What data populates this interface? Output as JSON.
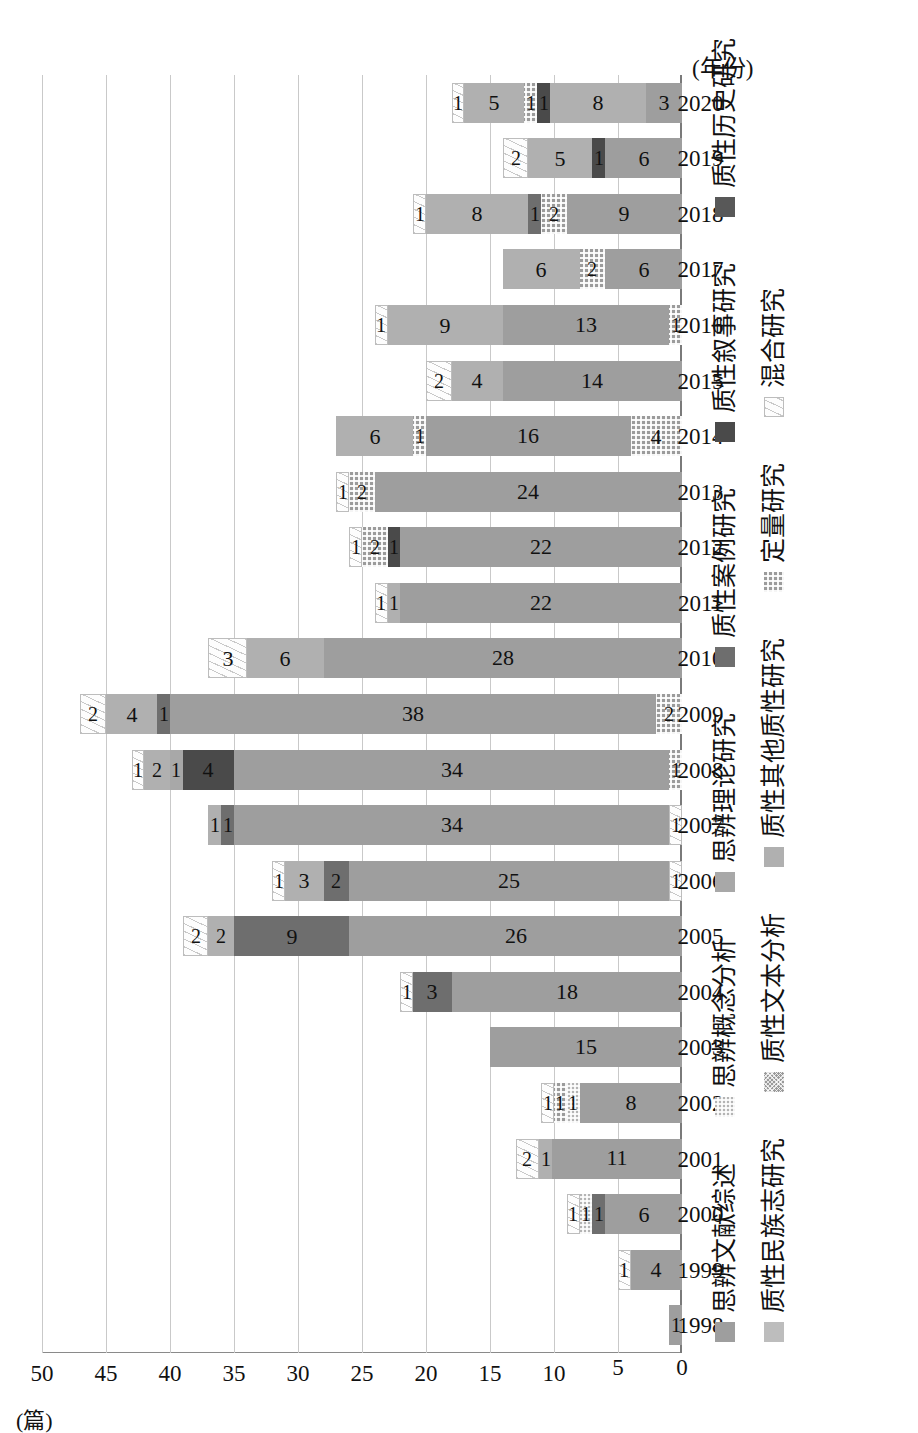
{
  "chart_data": {
    "type": "bar",
    "subtype": "stacked-bar",
    "orientation": "vertical (image rotated 90° counter-clockwise)",
    "title": "",
    "xlabel": "(年份)",
    "ylabel": "(篇)",
    "ylim": [
      0,
      50
    ],
    "ytick_step": 5,
    "yticks": [
      "0",
      "5",
      "10",
      "15",
      "20",
      "25",
      "30",
      "35",
      "40",
      "45",
      "50"
    ],
    "grid": "horizontal gridlines at every 5 units",
    "legend_position": "below plot, three rows",
    "categories": [
      "1998",
      "1999",
      "2000",
      "2001",
      "2002",
      "2003",
      "2004",
      "2005",
      "2006",
      "2007",
      "2008",
      "2009",
      "2010",
      "2011",
      "2012",
      "2013",
      "2014",
      "2015",
      "2016",
      "2017",
      "2018",
      "2019",
      "2020"
    ],
    "series": [
      {
        "name": "思辨文献综述",
        "key": "sbwxzs",
        "color": "#9e9e9e",
        "values": [
          1,
          4,
          6,
          11,
          8,
          15,
          18,
          26,
          25,
          34,
          34,
          38,
          28,
          22,
          22,
          24,
          16,
          14,
          13,
          6,
          9,
          6,
          3
        ]
      },
      {
        "name": "思辨概念分析",
        "key": "sbgnfx",
        "color": "#b4b4b4",
        "values": [
          0,
          0,
          1,
          0,
          1,
          0,
          0,
          0,
          0,
          0,
          0,
          0,
          0,
          0,
          0,
          0,
          0,
          0,
          0,
          0,
          0,
          0,
          0
        ]
      },
      {
        "name": "思辨理论研究",
        "key": "sbllyj",
        "color": "#a8a8a8",
        "values": [
          0,
          0,
          0,
          0,
          0,
          0,
          0,
          0,
          0,
          0,
          1,
          0,
          0,
          0,
          0,
          0,
          0,
          0,
          0,
          0,
          0,
          0,
          0
        ]
      },
      {
        "name": "质性民族志研究",
        "key": "zxmzz",
        "color": "#bdbdbd",
        "values": [
          0,
          0,
          0,
          0,
          0,
          0,
          0,
          0,
          0,
          0,
          0,
          0,
          0,
          0,
          0,
          0,
          0,
          0,
          0,
          0,
          0,
          0,
          0
        ]
      },
      {
        "name": "质性文本分析",
        "key": "zxwbfx",
        "color": "#9a9a9a",
        "values": [
          0,
          0,
          0,
          0,
          0,
          0,
          0,
          0,
          0,
          0,
          0,
          0,
          0,
          0,
          0,
          0,
          0,
          0,
          0,
          0,
          0,
          0,
          0
        ]
      },
      {
        "name": "质性其他质性研究",
        "key": "zxqtzx",
        "color": "#b0b0b0",
        "values": [
          0,
          0,
          0,
          0,
          0,
          0,
          0,
          0,
          0,
          0,
          0,
          0,
          0,
          0,
          0,
          0,
          0,
          0,
          0,
          0,
          0,
          0,
          0
        ]
      },
      {
        "name": "质性案例研究",
        "key": "zxalyj",
        "color": "#6e6e6e",
        "values": [
          0,
          0,
          1,
          0,
          0,
          0,
          3,
          9,
          2,
          1,
          4,
          0,
          0,
          1,
          0,
          0,
          0,
          0,
          0,
          0,
          0,
          0,
          0
        ]
      },
      {
        "name": "质性叙事研究",
        "key": "zxxsyj",
        "color": "#4a4a4a",
        "values": [
          0,
          0,
          0,
          0,
          0,
          0,
          0,
          0,
          0,
          0,
          0,
          0,
          0,
          0,
          0,
          0,
          0,
          0,
          0,
          0,
          0,
          1,
          1
        ]
      },
      {
        "name": "质性历史研究",
        "key": "zxlsyj",
        "color": "#585858",
        "values": [
          0,
          0,
          0,
          0,
          0,
          0,
          0,
          0,
          0,
          0,
          0,
          0,
          0,
          0,
          0,
          0,
          0,
          0,
          0,
          0,
          0,
          0,
          0
        ]
      },
      {
        "name": "定量研究",
        "key": "dlyj",
        "color": "#9b9b9b",
        "values": [
          0,
          0,
          0,
          0,
          1,
          0,
          0,
          0,
          0,
          0,
          0,
          0,
          0,
          0,
          2,
          2,
          1,
          0,
          0,
          2,
          2,
          0,
          1
        ]
      },
      {
        "name": "混合研究",
        "key": "hhyj",
        "color": "#fdfdfd",
        "values": [
          0,
          1,
          1,
          2,
          1,
          0,
          1,
          2,
          1,
          1,
          1,
          2,
          3,
          1,
          1,
          1,
          0,
          2,
          1,
          0,
          1,
          2,
          1
        ]
      }
    ],
    "base_segments": {
      "note": "small segments drawn at the zero end of some bars",
      "values": {
        "2006": 1,
        "2007": 1,
        "2008": 1,
        "2009": 2,
        "2014": 4,
        "2016": 1
      }
    },
    "bars": [
      {
        "year": "1998",
        "total": 1,
        "segments": [
          {
            "key": "sbwxzs",
            "value": 1,
            "label": "1"
          }
        ]
      },
      {
        "year": "1999",
        "total": 5,
        "segments": [
          {
            "key": "sbwxzs",
            "value": 4,
            "label": "4"
          },
          {
            "key": "hhyj",
            "value": 1,
            "label": "1"
          }
        ]
      },
      {
        "year": "2000",
        "total": 9,
        "segments": [
          {
            "key": "sbwxzs",
            "value": 6,
            "label": "6"
          },
          {
            "key": "zxalyj",
            "value": 1,
            "label": "1"
          },
          {
            "key": "sbgnfx",
            "value": 1,
            "label": "1"
          },
          {
            "key": "hhyj",
            "value": 1,
            "label": "1"
          }
        ]
      },
      {
        "year": "2001",
        "total": 13,
        "segments": [
          {
            "key": "sbwxzs",
            "value": 11,
            "label": "11"
          },
          {
            "key": "zxqtzx",
            "value": 1,
            "label": "1"
          },
          {
            "key": "hhyj",
            "value": 2,
            "label": "2"
          }
        ]
      },
      {
        "year": "2002",
        "total": 11,
        "segments": [
          {
            "key": "sbwxzs",
            "value": 8,
            "label": "8"
          },
          {
            "key": "sbgnfx",
            "value": 1,
            "label": "1"
          },
          {
            "key": "dlyj",
            "value": 1,
            "label": "1"
          },
          {
            "key": "hhyj",
            "value": 1,
            "label": "1"
          }
        ]
      },
      {
        "year": "2003",
        "total": 15,
        "segments": [
          {
            "key": "sbwxzs",
            "value": 15,
            "label": "15"
          }
        ]
      },
      {
        "year": "2004",
        "total": 22,
        "segments": [
          {
            "key": "sbwxzs",
            "value": 18,
            "label": "18"
          },
          {
            "key": "zxalyj",
            "value": 3,
            "label": "3"
          },
          {
            "key": "hhyj",
            "value": 1,
            "label": "1"
          }
        ]
      },
      {
        "year": "2005",
        "total": 39,
        "segments": [
          {
            "key": "sbwxzs",
            "value": 26,
            "label": "26"
          },
          {
            "key": "zxalyj",
            "value": 9,
            "label": "9"
          },
          {
            "key": "zxqtzx",
            "value": 2,
            "label": "2"
          },
          {
            "key": "hhyj",
            "value": 2,
            "label": "2"
          }
        ]
      },
      {
        "year": "2006",
        "total": 32,
        "segments": [
          {
            "key": "hhyj",
            "value": 1,
            "label": "1"
          },
          {
            "key": "sbwxzs",
            "value": 25,
            "label": "25"
          },
          {
            "key": "zxalyj",
            "value": 2,
            "label": "2"
          },
          {
            "key": "zxqtzx",
            "value": 3,
            "label": "3"
          },
          {
            "key": "hhyj",
            "value": 1,
            "label": "1"
          }
        ]
      },
      {
        "year": "2007",
        "total": 37,
        "segments": [
          {
            "key": "hhyj",
            "value": 1,
            "label": "1"
          },
          {
            "key": "sbwxzs",
            "value": 34,
            "label": "34"
          },
          {
            "key": "zxalyj",
            "value": 1,
            "label": "1"
          },
          {
            "key": "zxqtzx",
            "value": 1,
            "label": "1"
          }
        ]
      },
      {
        "year": "2008",
        "total": 43,
        "segments": [
          {
            "key": "dlyj",
            "value": 1,
            "label": "1"
          },
          {
            "key": "sbwxzs",
            "value": 34,
            "label": "34"
          },
          {
            "key": "zxxsyj",
            "value": 4,
            "label": "4"
          },
          {
            "key": "sbllyj",
            "value": 1,
            "label": "1"
          },
          {
            "key": "zxqtzx",
            "value": 2,
            "label": "2"
          },
          {
            "key": "hhyj",
            "value": 1,
            "label": "1"
          }
        ]
      },
      {
        "year": "2009",
        "total": 47,
        "segments": [
          {
            "key": "dlyj",
            "value": 2,
            "label": "2"
          },
          {
            "key": "sbwxzs",
            "value": 38,
            "label": "38"
          },
          {
            "key": "zxalyj",
            "value": 1,
            "label": "1"
          },
          {
            "key": "zxqtzx",
            "value": 4,
            "label": "4"
          },
          {
            "key": "hhyj",
            "value": 2,
            "label": "2"
          }
        ]
      },
      {
        "year": "2010",
        "total": 37,
        "segments": [
          {
            "key": "sbwxzs",
            "value": 28,
            "label": "28"
          },
          {
            "key": "zxqtzx",
            "value": 6,
            "label": "6"
          },
          {
            "key": "hhyj",
            "value": 3,
            "label": "3"
          }
        ]
      },
      {
        "year": "2011",
        "total": 24,
        "segments": [
          {
            "key": "sbwxzs",
            "value": 22,
            "label": "22"
          },
          {
            "key": "zxqtzx",
            "value": 1,
            "label": "1"
          },
          {
            "key": "hhyj",
            "value": 1,
            "label": "1"
          }
        ]
      },
      {
        "year": "2012",
        "total": 26,
        "segments": [
          {
            "key": "sbwxzs",
            "value": 22,
            "label": "22"
          },
          {
            "key": "zxxsyj",
            "value": 1,
            "label": "1"
          },
          {
            "key": "dlyj",
            "value": 2,
            "label": "2"
          },
          {
            "key": "hhyj",
            "value": 1,
            "label": "1"
          }
        ]
      },
      {
        "year": "2013",
        "total": 27,
        "segments": [
          {
            "key": "sbwxzs",
            "value": 24,
            "label": "24"
          },
          {
            "key": "dlyj",
            "value": 2,
            "label": "2"
          },
          {
            "key": "hhyj",
            "value": 1,
            "label": "1"
          }
        ]
      },
      {
        "year": "2014",
        "total": 27,
        "segments": [
          {
            "key": "dlyj",
            "value": 4,
            "label": "4"
          },
          {
            "key": "sbwxzs",
            "value": 16,
            "label": "16"
          },
          {
            "key": "dlyj",
            "value": 1,
            "label": "1"
          },
          {
            "key": "zxqtzx",
            "value": 6,
            "label": "6"
          }
        ]
      },
      {
        "year": "2015",
        "total": 20,
        "segments": [
          {
            "key": "sbwxzs",
            "value": 14,
            "label": "14"
          },
          {
            "key": "zxqtzx",
            "value": 4,
            "label": "4"
          },
          {
            "key": "hhyj",
            "value": 2,
            "label": "2"
          }
        ]
      },
      {
        "year": "2016",
        "total": 24,
        "segments": [
          {
            "key": "dlyj",
            "value": 1,
            "label": "1"
          },
          {
            "key": "sbwxzs",
            "value": 13,
            "label": "13"
          },
          {
            "key": "zxqtzx",
            "value": 9,
            "label": "9"
          },
          {
            "key": "hhyj",
            "value": 1,
            "label": "1"
          }
        ]
      },
      {
        "year": "2017",
        "total": 14,
        "segments": [
          {
            "key": "sbwxzs",
            "value": 6,
            "label": "6"
          },
          {
            "key": "dlyj",
            "value": 2,
            "label": "2"
          },
          {
            "key": "zxqtzx",
            "value": 6,
            "label": "6"
          }
        ]
      },
      {
        "year": "2018",
        "total": 21,
        "segments": [
          {
            "key": "sbwxzs",
            "value": 9,
            "label": "9"
          },
          {
            "key": "dlyj",
            "value": 2,
            "label": "2"
          },
          {
            "key": "zxalyj",
            "value": 1,
            "label": "1"
          },
          {
            "key": "zxqtzx",
            "value": 8,
            "label": "8"
          },
          {
            "key": "hhyj",
            "value": 1,
            "label": "1"
          }
        ]
      },
      {
        "year": "2019",
        "total": 14,
        "segments": [
          {
            "key": "sbwxzs",
            "value": 6,
            "label": "6"
          },
          {
            "key": "zxxsyj",
            "value": 1,
            "label": "1"
          },
          {
            "key": "zxqtzx",
            "value": 5,
            "label": "5"
          },
          {
            "key": "hhyj",
            "value": 2,
            "label": "2"
          }
        ]
      },
      {
        "year": "2020",
        "total": 18,
        "segments": [
          {
            "key": "sbwxzs",
            "value": 3,
            "label": "3"
          },
          {
            "key": "zxqtzx",
            "value": 8,
            "label": "8"
          },
          {
            "key": "zxxsyj",
            "value": 1,
            "label": "1"
          },
          {
            "key": "dlyj",
            "value": 1,
            "label": "1"
          },
          {
            "key": "zxqtzx2",
            "value": 5,
            "label": "5"
          },
          {
            "key": "hhyj",
            "value": 1,
            "label": "1"
          }
        ]
      }
    ]
  },
  "axes": {
    "y_title": "(篇)",
    "x_title": "(年份)"
  },
  "legend": {
    "rows": [
      [
        {
          "key": "sbwxzs",
          "label": "思辨文献综述"
        },
        {
          "key": "sbgnfx",
          "label": "思辨概念分析"
        },
        {
          "key": "sbllyj",
          "label": "思辨理论研究"
        },
        {
          "key": "zxalyj",
          "label": "质性案例研究"
        },
        {
          "key": "zxxsyj",
          "label": "质性叙事研究"
        },
        {
          "key": "zxlsyj",
          "label": "质性历史研究"
        }
      ],
      [
        {
          "key": "zxmzz",
          "label": "质性民族志研究"
        },
        {
          "key": "zxwbfx",
          "label": "质性文本分析"
        },
        {
          "key": "zxqtzx",
          "label": "质性其他质性研究"
        },
        {
          "key": "dlyj",
          "label": "定量研究"
        },
        {
          "key": "hhyj",
          "label": "混合研究"
        }
      ]
    ]
  }
}
